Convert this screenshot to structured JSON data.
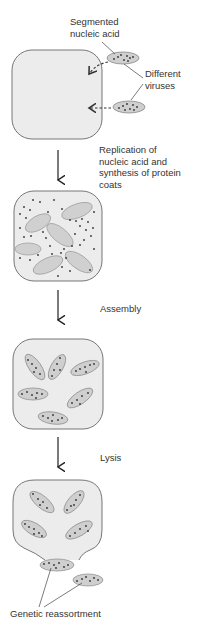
{
  "diagram": {
    "labels": {
      "segmented_nucleic_acid": [
        "Segmented",
        "nucleic acid"
      ],
      "different_viruses": [
        "Different",
        "viruses"
      ],
      "replication": [
        "Replication of",
        "nucleic acid and",
        "synthesis of protein",
        "coats"
      ],
      "assembly": "Assembly",
      "lysis": "Lysis",
      "genetic_reassortment": "Genetic reassortment"
    },
    "stages": [
      {
        "id": "infection",
        "description": "Two different viruses with segmented nucleic acid enter the host cell"
      },
      {
        "id": "replication",
        "description": "Replication of nucleic acid and synthesis of protein coats"
      },
      {
        "id": "assembly",
        "description": "Assembly"
      },
      {
        "id": "lysis",
        "description": "Lysis"
      },
      {
        "id": "release",
        "description": "Genetic reassortment"
      }
    ],
    "colors": {
      "cell_fill": "#ececec",
      "cell_stroke": "#777777",
      "virus_fill": "#cfcfcf",
      "virus_stroke": "#888888",
      "dot": "#333333",
      "text": "#333333"
    }
  }
}
